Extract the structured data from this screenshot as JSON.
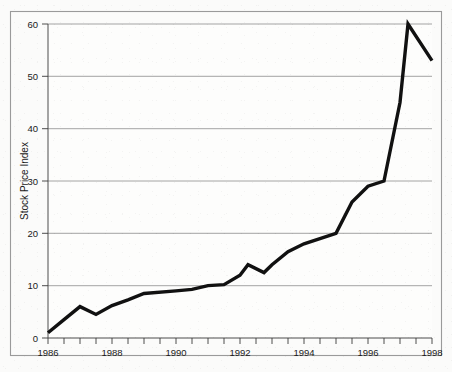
{
  "chart_data": {
    "type": "line",
    "title": "",
    "xlabel": "",
    "ylabel": "Stock Price Index",
    "xlim": [
      1986,
      1998
    ],
    "ylim": [
      0,
      60
    ],
    "grid": true,
    "legend": "none",
    "y_ticks": [
      0,
      10,
      20,
      30,
      40,
      50,
      60
    ],
    "y_tick_labels": [
      "0",
      "10",
      "20",
      "30",
      "40",
      "50",
      "60"
    ],
    "x_ticks": [
      1986,
      1988,
      1990,
      1992,
      1994,
      1996,
      1998
    ],
    "x_tick_labels": [
      "1986",
      "1988",
      "1990",
      "1992",
      "1994",
      "1996",
      "1998"
    ],
    "x_minor_tick_step": 0.5,
    "series": [
      {
        "name": "Stock Price Index",
        "color": "#111111",
        "x": [
          1986.0,
          1986.5,
          1987.0,
          1987.5,
          1988.0,
          1988.5,
          1989.0,
          1990.0,
          1990.5,
          1991.0,
          1991.5,
          1992.0,
          1992.25,
          1992.75,
          1993.0,
          1993.5,
          1994.0,
          1995.0,
          1995.5,
          1996.0,
          1996.5,
          1997.0,
          1997.25,
          1998.0
        ],
        "y": [
          1.0,
          3.5,
          6.0,
          4.5,
          6.2,
          7.3,
          8.5,
          9.0,
          9.3,
          10.0,
          10.2,
          12.0,
          14.0,
          12.5,
          14.0,
          16.5,
          18.0,
          20.0,
          26.0,
          29.0,
          30.0,
          45.0,
          60.0,
          53.0
        ]
      }
    ]
  },
  "axes": {
    "y_axis_title": "Stock Price Index"
  }
}
